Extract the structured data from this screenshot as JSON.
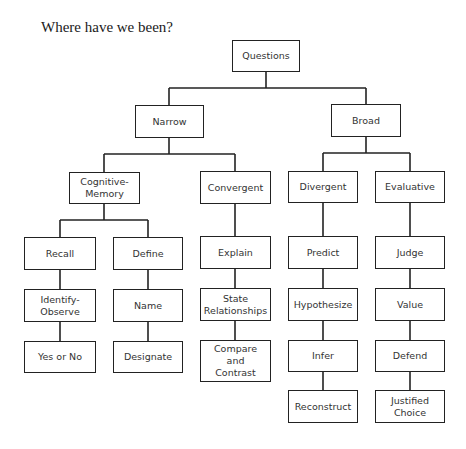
{
  "heading": "Where have we been?",
  "colors": {
    "line": "#222222",
    "text": "#333333",
    "background": "#ffffff"
  },
  "nodes": {
    "questions": "Questions",
    "narrow": "Narrow",
    "broad": "Broad",
    "cognitive_memory": "Cognitive-\nMemory",
    "convergent": "Convergent",
    "divergent": "Divergent",
    "evaluative": "Evaluative",
    "recall": "Recall",
    "define": "Define",
    "identify_observe": "Identify-\nObserve",
    "name": "Name",
    "yes_or_no": "Yes or No",
    "designate": "Designate",
    "explain": "Explain",
    "state_relationships": "State\nRelationships",
    "compare_and_contrast": "Compare\nand\nContrast",
    "predict": "Predict",
    "hypothesize": "Hypothesize",
    "infer": "Infer",
    "reconstruct": "Reconstruct",
    "judge": "Judge",
    "value": "Value",
    "defend": "Defend",
    "justified_choice": "Justified\nChoice"
  },
  "tree": {
    "Questions": {
      "Narrow": {
        "Cognitive-Memory": {
          "Recall": [
            "Identify-Observe",
            "Yes or No"
          ],
          "Define": [
            "Name",
            "Designate"
          ]
        },
        "Convergent": [
          "Explain",
          "State Relationships",
          "Compare and Contrast"
        ]
      },
      "Broad": {
        "Divergent": [
          "Predict",
          "Hypothesize",
          "Infer",
          "Reconstruct"
        ],
        "Evaluative": [
          "Judge",
          "Value",
          "Defend",
          "Justified Choice"
        ]
      }
    }
  }
}
